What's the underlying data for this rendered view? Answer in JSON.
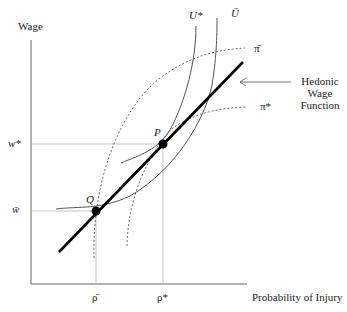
{
  "axes": {
    "y_label": "Wage",
    "x_label": "Probability of Injury"
  },
  "y_ticks": {
    "w_star": "w*",
    "w_bar": "w̄"
  },
  "x_ticks": {
    "rho_bar": "ρ̄",
    "rho_star": "ρ*"
  },
  "curves": {
    "u_star": "U*",
    "u_bar": "Ū",
    "pi_bar": "π̄",
    "pi_star": "π*"
  },
  "points": {
    "p": "P",
    "q": "Q"
  },
  "annotation": {
    "line1": "Hedonic",
    "line2": "Wage",
    "line3": "Function"
  },
  "colors": {
    "hedonic_line": "#000000",
    "indifference": "#555555",
    "isoprofit": "#444444",
    "guides": "#999999"
  }
}
